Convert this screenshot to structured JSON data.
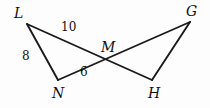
{
  "figure": {
    "background_color": "#fdfdfd",
    "line_color": "#1a1a1a",
    "text_color": "#111111",
    "vertices": [
      {
        "name": "L",
        "label": "L",
        "x": 27,
        "y": 24,
        "label_x": 14,
        "label_y": 6
      },
      {
        "name": "G",
        "label": "G",
        "x": 190,
        "y": 22,
        "label_x": 186,
        "label_y": 4
      },
      {
        "name": "M",
        "label": "M",
        "x": 110,
        "y": 60,
        "label_x": 101,
        "label_y": 40
      },
      {
        "name": "N",
        "label": "N",
        "x": 58,
        "y": 80,
        "label_x": 52,
        "label_y": 86
      },
      {
        "name": "H",
        "label": "H",
        "x": 152,
        "y": 80,
        "label_x": 148,
        "label_y": 86
      }
    ],
    "segments": [
      {
        "name": "segment-L-H",
        "from": "L",
        "to": "H",
        "x1": 27,
        "y1": 24,
        "x2": 152,
        "y2": 80
      },
      {
        "name": "segment-N-G",
        "from": "N",
        "to": "G",
        "x1": 58,
        "y1": 80,
        "x2": 190,
        "y2": 22
      },
      {
        "name": "segment-L-N",
        "from": "L",
        "to": "N",
        "x1": 27,
        "y1": 24,
        "x2": 58,
        "y2": 80
      },
      {
        "name": "segment-G-H",
        "from": "G",
        "to": "H",
        "x1": 190,
        "y1": 22,
        "x2": 152,
        "y2": 80
      }
    ],
    "measures": [
      {
        "name": "measure-LM",
        "value": "10",
        "segment": "LM",
        "x": 61,
        "y": 21
      },
      {
        "name": "measure-LN",
        "value": "8",
        "segment": "LN",
        "x": 22,
        "y": 50
      },
      {
        "name": "measure-NM",
        "value": "6",
        "segment": "NM",
        "x": 80,
        "y": 66
      }
    ]
  }
}
